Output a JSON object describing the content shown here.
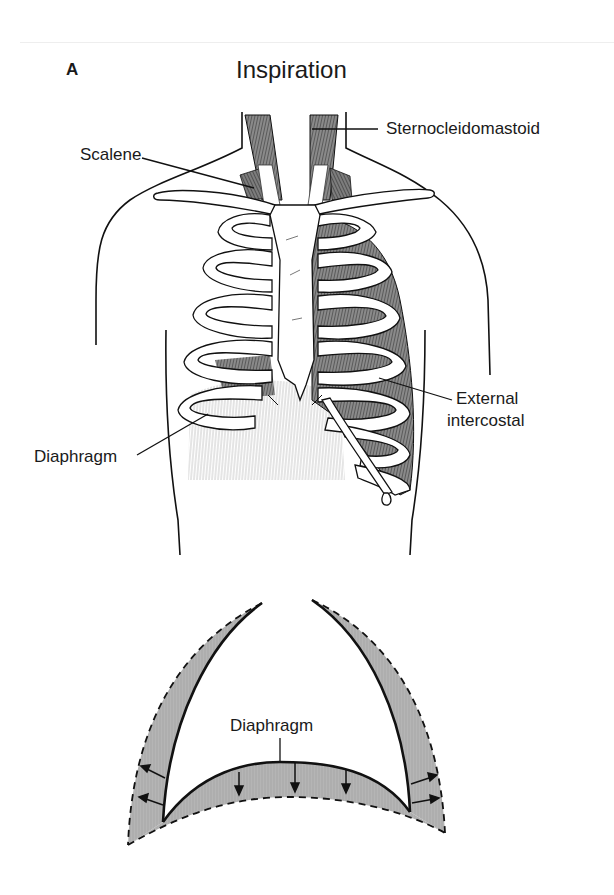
{
  "figure": {
    "panel_letter": "A",
    "title": "Inspiration",
    "top_cropped_text": ""
  },
  "anatomy_labels": {
    "sternocleidomastoid": "Sternocleidomastoid",
    "scalene": "Scalene",
    "external_intercostal_line1": "External",
    "external_intercostal_line2": "intercostal",
    "diaphragm": "Diaphragm"
  },
  "schematic": {
    "diaphragm_label": "Diaphragm",
    "shading_color": "#b3b3b3",
    "line_color": "#111111",
    "legend": {
      "solid_line": "resting position",
      "dashed_line": "inspiratory position"
    }
  }
}
